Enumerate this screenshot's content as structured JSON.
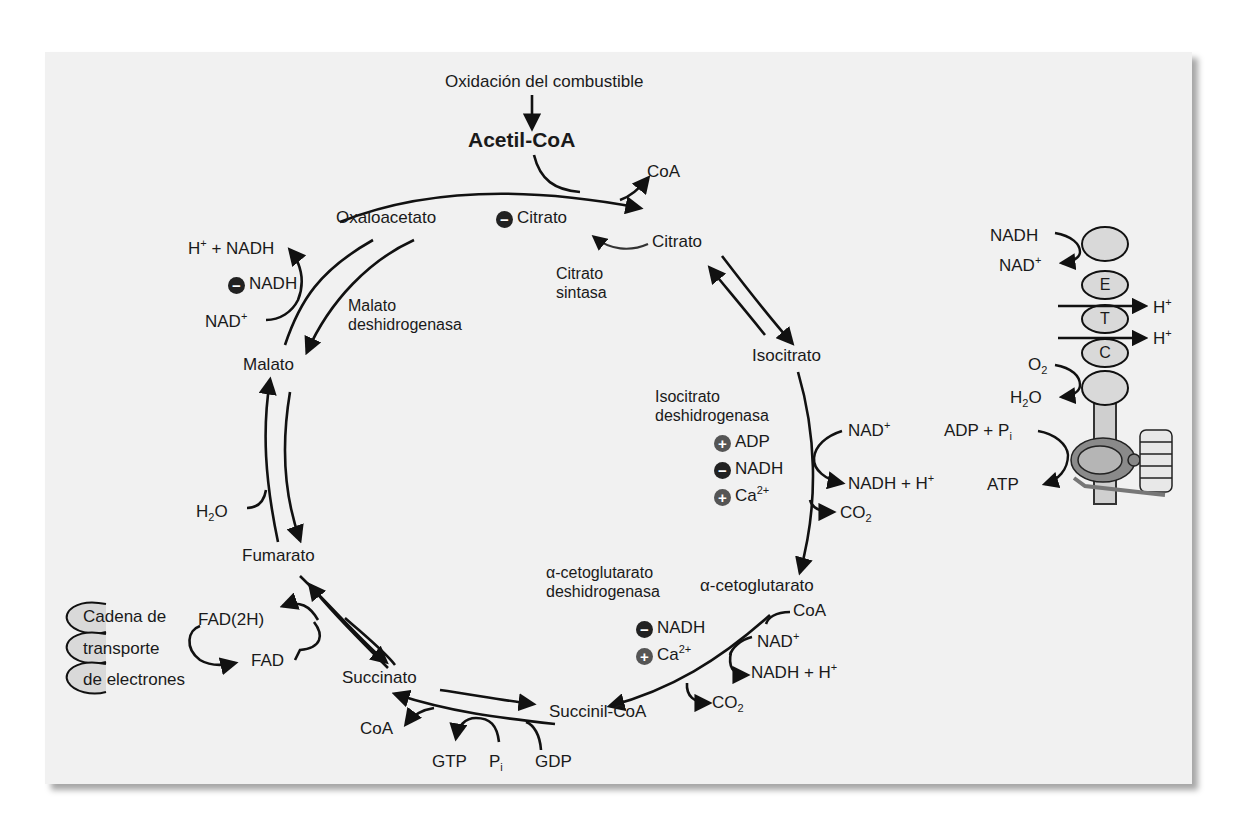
{
  "figure": {
    "title_input": "Oxidación del combustible",
    "entry": "Acetil-CoA",
    "intermediates": {
      "oxaloacetato": "Oxaloacetato",
      "citrato": "Citrato",
      "isocitrato": "Isocitrato",
      "alpha_ketoglutarato": "α-cetoglutarato",
      "succinil_coa": "Succinil-CoA",
      "succinato": "Succinato",
      "fumarato": "Fumarato",
      "malato": "Malato"
    },
    "enzymes": {
      "citrato_sintasa": [
        "Citrato",
        "sintasa"
      ],
      "isocitrato_dh": [
        "Isocitrato",
        "deshidrogenasa"
      ],
      "akg_dh": [
        "α-cetoglutarato",
        "deshidrogenasa"
      ],
      "malato_dh": [
        "Malato",
        "deshidrogenasa"
      ]
    },
    "regulators": {
      "citrato_sintasa": [
        {
          "sign": "minus",
          "label": "Citrato"
        }
      ],
      "malato_dh": [
        {
          "sign": "minus",
          "label": "NADH"
        }
      ],
      "isocitrato_dh": [
        {
          "sign": "plus",
          "label": "ADP"
        },
        {
          "sign": "minus",
          "label": "NADH"
        },
        {
          "sign": "plus",
          "label": "Ca",
          "sup": "2+"
        }
      ],
      "akg_dh": [
        {
          "sign": "minus",
          "label": "NADH"
        },
        {
          "sign": "plus",
          "label": "Ca",
          "sup": "2+"
        }
      ]
    },
    "cofactors": {
      "coa_release_citrate": "CoA",
      "malate_nad_in": "NAD",
      "malate_nadh_out": "H⁺ + NADH",
      "icdh_nad_in": "NAD",
      "icdh_nadh_out": "NADH + H",
      "icdh_co2": "CO",
      "akg_coa_in": "CoA",
      "akg_nad_in": "NAD",
      "akg_nadh_out": "NADH + H",
      "akg_co2": "CO",
      "scs_coa_out": "CoA",
      "scs_gtp": "GTP",
      "scs_pi": "P",
      "scs_gdp": "GDP",
      "fumarase_h2o": "H",
      "sdh_fad2h": "FAD(2H)",
      "sdh_fad": "FAD"
    },
    "etc_box": [
      "Cadena de",
      "transporte",
      "de electrones"
    ],
    "etc_panel": {
      "nadh": "NADH",
      "nad": "NAD",
      "complex_letters": [
        "E",
        "T",
        "C"
      ],
      "h_out_1": "H",
      "h_out_2": "H",
      "o2": "O",
      "h2o": "H",
      "adp_pi": "ADP + P",
      "atp": "ATP"
    },
    "sign_symbols": {
      "plus": "+",
      "minus": "−"
    },
    "colors": {
      "panel_bg": "#f1f1f1",
      "ink": "#1a1a1a",
      "complex_fill": "#d9d9d9",
      "minus_badge": "#222222",
      "plus_badge": "#555555"
    }
  }
}
